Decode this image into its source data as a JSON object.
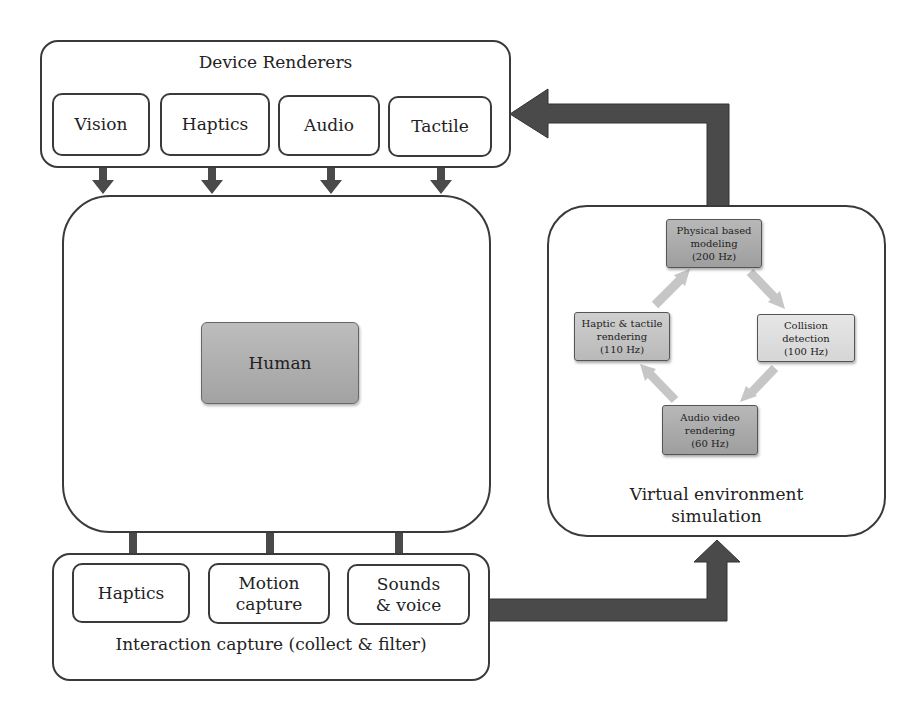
{
  "device_renderers": {
    "title": "Device Renderers",
    "items": [
      {
        "label": "Vision"
      },
      {
        "label": "Haptics"
      },
      {
        "label": "Audio"
      },
      {
        "label": "Tactile"
      }
    ]
  },
  "human": {
    "label": "Human"
  },
  "interaction_capture": {
    "title": "Interaction capture (collect & filter)",
    "items": [
      {
        "label": "Haptics"
      },
      {
        "label": "Motion capture"
      },
      {
        "label": "Sounds & voice"
      }
    ]
  },
  "virtual_environment": {
    "title": "Virtual environment simulation",
    "nodes": [
      {
        "id": "physical",
        "label": "Physical based modeling",
        "rate": "(200 Hz)"
      },
      {
        "id": "haptic",
        "label": "Haptic & tactile rendering",
        "rate": "(110 Hz)"
      },
      {
        "id": "collision",
        "label": "Collision detection",
        "rate": "(100 Hz)"
      },
      {
        "id": "audiovideo",
        "label": "Audio video rendering",
        "rate": "(60 Hz)"
      }
    ]
  },
  "colors": {
    "outline": "#3a3a3a",
    "arrow_dark": "#4a4a4a",
    "arrow_light": "#c8c8c8"
  }
}
